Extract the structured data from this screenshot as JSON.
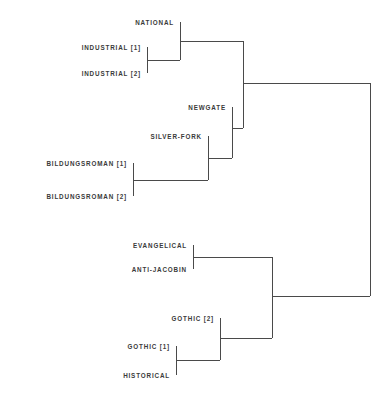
{
  "chart_data": {
    "type": "dendrogram",
    "title": "",
    "subtitle": "",
    "xlabel": "",
    "ylabel": "",
    "orientation": "horizontal-right",
    "grid": false,
    "legend": null,
    "line_color": "#4a4a4a",
    "text_color": "#3a3a3a",
    "background_color": "#ffffff",
    "line_width": 1,
    "leaves": [
      {
        "id": "national",
        "label": "NATIONAL",
        "y": 22,
        "x_tip": 180
      },
      {
        "id": "industrial_1",
        "label": "INDUSTRIAL [1]",
        "y": 47,
        "x_tip": 147
      },
      {
        "id": "industrial_2",
        "label": "INDUSTRIAL [2]",
        "y": 73,
        "x_tip": 147
      },
      {
        "id": "newgate",
        "label": "NEWGATE",
        "y": 107,
        "x_tip": 232
      },
      {
        "id": "silver_fork",
        "label": "SILVER-FORK",
        "y": 136,
        "x_tip": 208
      },
      {
        "id": "bildungsroman_1",
        "label": "BILDUNGSROMAN [1]",
        "y": 163,
        "x_tip": 133
      },
      {
        "id": "bildungsroman_2",
        "label": "BILDUNGSROMAN [2]",
        "y": 196,
        "x_tip": 133
      },
      {
        "id": "evangelical",
        "label": "EVANGELICAL",
        "y": 245,
        "x_tip": 193
      },
      {
        "id": "anti_jacobin",
        "label": "ANTI-JACOBIN",
        "y": 269,
        "x_tip": 193
      },
      {
        "id": "gothic_2",
        "label": "GOTHIC [2]",
        "y": 318,
        "x_tip": 220
      },
      {
        "id": "gothic_1",
        "label": "GOTHIC [1]",
        "y": 346,
        "x_tip": 176
      },
      {
        "id": "historical",
        "label": "HISTORICAL",
        "y": 375,
        "x_tip": 176
      }
    ],
    "merges": [
      {
        "id": "m_industrial",
        "x": 147,
        "y_top": 47,
        "y_bottom": 73,
        "y_mid": 60,
        "x_out": 180,
        "children": [
          "industrial_1",
          "industrial_2"
        ]
      },
      {
        "id": "m_national_ind",
        "x": 180,
        "y_top": 22,
        "y_bottom": 60,
        "y_mid": 41,
        "x_out": 243,
        "children": [
          "national",
          "m_industrial"
        ]
      },
      {
        "id": "m_bildungsroman",
        "x": 133,
        "y_top": 163,
        "y_bottom": 196,
        "y_mid": 180,
        "x_out": 208,
        "children": [
          "bildungsroman_1",
          "bildungsroman_2"
        ]
      },
      {
        "id": "m_silver_bild",
        "x": 208,
        "y_top": 136,
        "y_bottom": 180,
        "y_mid": 158,
        "x_out": 232,
        "children": [
          "silver_fork",
          "m_bildungsroman"
        ]
      },
      {
        "id": "m_newgate_sf",
        "x": 232,
        "y_top": 107,
        "y_bottom": 158,
        "y_mid": 128,
        "x_out": 243,
        "children": [
          "newgate",
          "m_silver_bild"
        ]
      },
      {
        "id": "m_upper",
        "x": 243,
        "y_top": 41,
        "y_bottom": 128,
        "y_mid": 83,
        "x_out": 370,
        "children": [
          "m_national_ind",
          "m_newgate_sf"
        ]
      },
      {
        "id": "m_evang_anti",
        "x": 193,
        "y_top": 245,
        "y_bottom": 269,
        "y_mid": 257,
        "x_out": 272,
        "children": [
          "evangelical",
          "anti_jacobin"
        ]
      },
      {
        "id": "m_gothic_hist",
        "x": 176,
        "y_top": 346,
        "y_bottom": 375,
        "y_mid": 360,
        "x_out": 220,
        "children": [
          "gothic_1",
          "historical"
        ]
      },
      {
        "id": "m_gothic2_gh",
        "x": 220,
        "y_top": 318,
        "y_bottom": 360,
        "y_mid": 338,
        "x_out": 272,
        "children": [
          "gothic_2",
          "m_gothic_hist"
        ]
      },
      {
        "id": "m_lower",
        "x": 272,
        "y_top": 257,
        "y_bottom": 338,
        "y_mid": 296,
        "x_out": 370,
        "children": [
          "m_evang_anti",
          "m_gothic2_gh"
        ]
      },
      {
        "id": "m_all",
        "x": 370,
        "y_top": 83,
        "y_bottom": 296,
        "y_mid": 190,
        "x_out": null,
        "children": [
          "m_upper",
          "m_lower"
        ]
      }
    ],
    "label_gap": 6
  }
}
